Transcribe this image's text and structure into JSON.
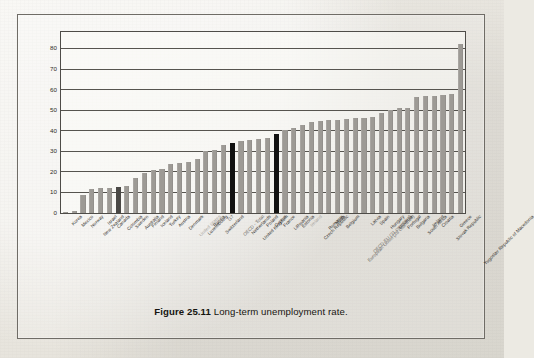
{
  "figure": {
    "caption_number": "Figure 25.11",
    "caption_text": "Long-term unemployment rate."
  },
  "chart_data": {
    "type": "bar",
    "title": "Long-term unemployment rate",
    "xlabel": "",
    "ylabel": "",
    "ylim": [
      0,
      88
    ],
    "yticks": [
      0,
      10,
      20,
      30,
      40,
      50,
      60,
      70,
      80
    ],
    "ytick_labels": [
      "0",
      "10",
      "20",
      "30",
      "40",
      "50",
      "60",
      "70",
      "80"
    ],
    "grid": true,
    "legend": "none",
    "bar_color": "#9d9a95",
    "highlight_color": "#121212",
    "secondary_highlight_color": "#4a4845",
    "categories": [
      "Korea",
      "Mexico",
      "Norway",
      "New Zealand",
      "Israel",
      "Canada",
      "Colombia",
      "Sweden",
      "Australia",
      "Finland",
      "Iceland",
      "Turkey",
      "Austria",
      "Denmark",
      "United States",
      "Luxembourg",
      "Russia",
      "Switzerland",
      "G7",
      "OECD - Total",
      "Netherlands",
      "United Kingdom",
      "Poland",
      "Cyprus",
      "France",
      "Lithuania",
      "Estonia",
      "Ireland",
      "Czech Republic",
      "Romania",
      "Malta",
      "Belgium",
      "European Union (28 countries)",
      "OECD-EU (21 countries)",
      "Latvia",
      "Spain",
      "Hungary",
      "Slovenia",
      "Portugal",
      "Bulgaria",
      "South Africa",
      "Ireland",
      "Croatia",
      "Slovak Republic",
      "Greece",
      "Yugoslav Republic of Macedonia"
    ],
    "values": [
      0.3,
      1.2,
      9.0,
      11.5,
      12.0,
      12.3,
      12.6,
      13.0,
      16.8,
      19.3,
      21.0,
      21.6,
      24.0,
      24.4,
      24.8,
      26.1,
      30.3,
      30.8,
      33.0,
      34.0,
      35.0,
      35.6,
      36.0,
      36.3,
      38.4,
      40.4,
      41.2,
      42.8,
      44.4,
      44.5,
      45.0,
      45.2,
      45.5,
      46.0,
      46.4,
      46.8,
      48.4,
      50.2,
      51.0,
      51.2,
      56.3,
      56.8,
      57.0,
      57.3,
      57.9,
      82.2
    ],
    "highlighted_categories": [
      "Colombia",
      "OECD - Total",
      "France"
    ],
    "muted_label_categories": [
      "United States",
      "Ireland"
    ],
    "aggregate_label_categories": [
      "G7",
      "OECD - Total",
      "European Union (28 countries)",
      "OECD-EU (21 countries)"
    ]
  }
}
